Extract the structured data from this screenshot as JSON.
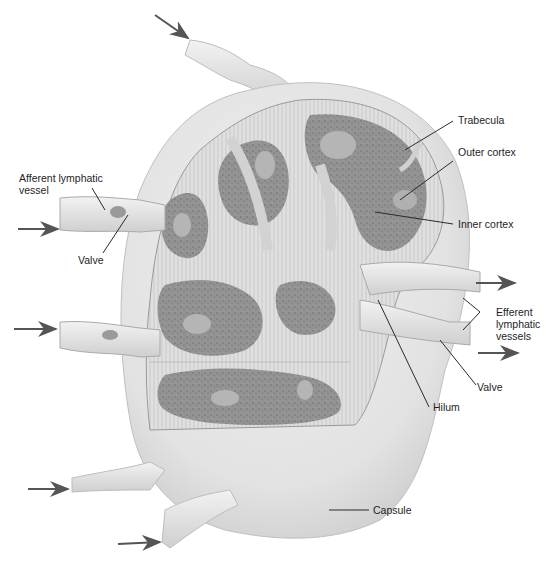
{
  "diagram": {
    "colors": {
      "capsule": "#e4e4e4",
      "capsule_shadow": "#c9c9c9",
      "cortex_dark": "#8f8f8f",
      "germinal_center": "#b5b5b5",
      "sinus_band": "#dcdcdc",
      "line": "#3a3a3a",
      "arrow": "#555555",
      "background": "#ffffff"
    },
    "labels": {
      "afferent": "Afferent lymphatic\nvessel",
      "valve_left": "Valve",
      "trabecula": "Trabecula",
      "outer_cortex": "Outer cortex",
      "inner_cortex": "Inner cortex",
      "efferent": "Efferent\nlymphatic\nvessels",
      "valve_right": "Valve",
      "hilum": "Hilum",
      "capsule": "Capsule"
    },
    "arrows": {
      "incoming_count": 5,
      "outgoing_count": 2
    }
  }
}
